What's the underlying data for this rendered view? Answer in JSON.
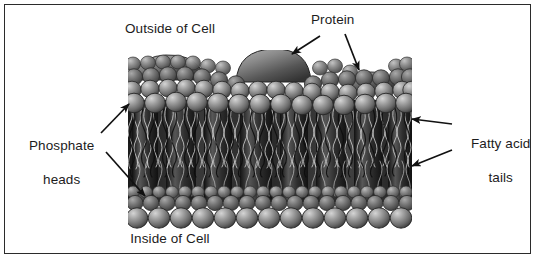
{
  "figure": {
    "width": 537,
    "height": 260,
    "border_color": "#2b2b2b",
    "background": "#ffffff"
  },
  "labels": {
    "outside_of_cell": "Outside of Cell",
    "inside_of_cell": "Inside of Cell",
    "protein": "Protein",
    "phosphate_heads_line1": "Phosphate",
    "phosphate_heads_line2": "heads",
    "fatty_acid_line1": "Fatty acid",
    "fatty_acid_line2": "tails"
  },
  "colors": {
    "text": "#1c1c1c",
    "arrow": "#111111",
    "head_light": "#b9b9b9",
    "head_mid": "#8c8c8c",
    "head_dark": "#4a4a4a",
    "head_outline": "#2a2a2a",
    "tail_dark": "#1a1a1a",
    "interior_dark": "#242424",
    "protein_light": "#a8a8a8",
    "protein_dark": "#3a3a3a"
  },
  "structures": {
    "membrane_left": 128,
    "membrane_right": 412,
    "upper_heads_top": 55,
    "upper_heads_bottom": 112,
    "tail_region_top": 112,
    "tail_region_bottom": 190,
    "lower_heads_top": 190,
    "lower_heads_bottom": 232,
    "proteins": [
      {
        "name": "left-bulge",
        "x": 168,
        "width": 66,
        "height": 14
      },
      {
        "name": "large-dome",
        "x": 270,
        "width": 70,
        "height": 30
      },
      {
        "name": "small-protein",
        "x": 370,
        "width": 46,
        "height": 16
      }
    ]
  },
  "arrows": {
    "protein_to_dome": {
      "from": [
        318,
        38
      ],
      "to": [
        288,
        56
      ]
    },
    "protein_to_small": {
      "from": [
        344,
        36
      ],
      "to": [
        360,
        74
      ]
    },
    "phosphate_to_top": {
      "from": [
        104,
        134
      ],
      "to": [
        133,
        102
      ]
    },
    "phosphate_to_bottom": {
      "from": [
        110,
        152
      ],
      "to": [
        148,
        196
      ]
    },
    "fatty_to_upper": {
      "from": [
        452,
        124
      ],
      "to": [
        408,
        120
      ]
    },
    "fatty_to_lower": {
      "from": [
        452,
        150
      ],
      "to": [
        408,
        166
      ]
    }
  }
}
